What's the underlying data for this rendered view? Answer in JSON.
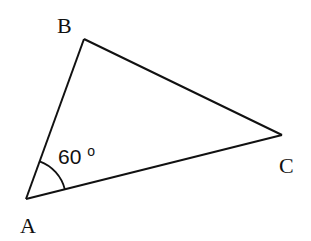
{
  "diagram": {
    "type": "triangle",
    "vertices": [
      {
        "id": "A",
        "label": "A",
        "x": 26,
        "y": 199
      },
      {
        "id": "B",
        "label": "B",
        "x": 84,
        "y": 39
      },
      {
        "id": "C",
        "label": "C",
        "x": 282,
        "y": 135
      }
    ],
    "edges": [
      [
        "A",
        "B"
      ],
      [
        "B",
        "C"
      ],
      [
        "C",
        "A"
      ]
    ],
    "angle_marks": [
      {
        "vertex": "A",
        "value": "60",
        "unit": "o",
        "text": "60°"
      }
    ],
    "colors": {
      "stroke": "#111111",
      "background": "#ffffff"
    }
  },
  "labels": {
    "A": "A",
    "B": "B",
    "C": "C",
    "angle_A_value": "60",
    "angle_A_degree": "o"
  }
}
